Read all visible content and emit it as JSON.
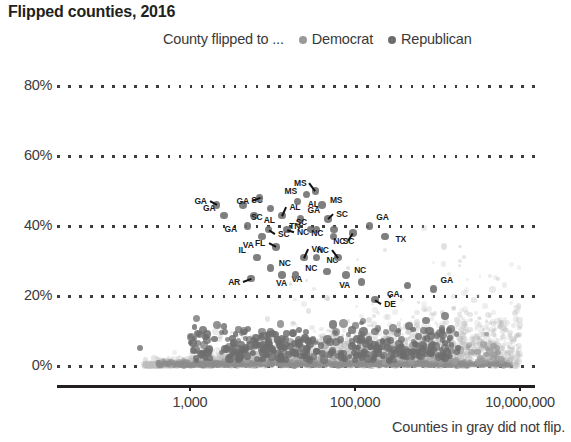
{
  "chart": {
    "title": "Flipped counties, 2016",
    "footnote": "Counties in gray did not flip.",
    "legend_prefix": "County flipped to ...",
    "legend": [
      {
        "label": "Democrat",
        "color": "#9a9a9a"
      },
      {
        "label": "Republican",
        "color": "#6d6d6d"
      }
    ]
  },
  "chart_data": {
    "type": "scatter",
    "title": "Flipped counties, 2016",
    "xlabel": "",
    "ylabel": "",
    "xscale": "log",
    "xlim": [
      250,
      30000000
    ],
    "ylim": [
      -3,
      88
    ],
    "grid": true,
    "grid_style": "dotted-horizontal",
    "legend_position": "top-center",
    "xtick_labels": [
      "1,000",
      "100,000",
      "10,000,000"
    ],
    "xtick_values": [
      1000,
      100000,
      10000000
    ],
    "ytick_labels": [
      "0%",
      "20%",
      "40%",
      "60%",
      "80%"
    ],
    "ytick_values": [
      0,
      20,
      40,
      60,
      80
    ],
    "annotation": "Counties in gray did not flip.",
    "series": [
      {
        "name": "Did not flip",
        "color": "#bdbdbd",
        "note": "Large low-opacity gray cloud concentrated near 0% and increasing in spread with county population"
      },
      {
        "name": "Flipped to Democrat",
        "color": "#9a9a9a",
        "note": "Medium-gray points, mostly larger-population counties"
      },
      {
        "name": "Flipped to Republican",
        "color": "#6d6d6d",
        "note": "Darker gray points spread from 0% up to about 50%"
      }
    ],
    "labeled_points": [
      {
        "state": "GA",
        "x": 2100,
        "y": 46
      },
      {
        "state": "GA",
        "x": 2600,
        "y": 43
      },
      {
        "state": "SC",
        "x": 4400,
        "y": 46
      },
      {
        "state": "GA",
        "x": 7000,
        "y": 48
      },
      {
        "state": "AL",
        "x": 6000,
        "y": 43
      },
      {
        "state": "SC",
        "x": 9500,
        "y": 45
      },
      {
        "state": "AL",
        "x": 13000,
        "y": 43
      },
      {
        "state": "AL",
        "x": 20000,
        "y": 47
      },
      {
        "state": "MS",
        "x": 26000,
        "y": 49
      },
      {
        "state": "MS",
        "x": 33000,
        "y": 50
      },
      {
        "state": "MS",
        "x": 40000,
        "y": 46
      },
      {
        "state": "GA",
        "x": 5000,
        "y": 40
      },
      {
        "state": "SC",
        "x": 9000,
        "y": 39
      },
      {
        "state": "VA",
        "x": 7500,
        "y": 37
      },
      {
        "state": "GA",
        "x": 22000,
        "y": 42
      },
      {
        "state": "NC",
        "x": 15000,
        "y": 39
      },
      {
        "state": "TN",
        "x": 29000,
        "y": 39
      },
      {
        "state": "SC",
        "x": 34000,
        "y": 39
      },
      {
        "state": "SC",
        "x": 47000,
        "y": 42
      },
      {
        "state": "NC",
        "x": 56000,
        "y": 39
      },
      {
        "state": "SC",
        "x": 55000,
        "y": 37
      },
      {
        "state": "NC",
        "x": 95000,
        "y": 38
      },
      {
        "state": "GA",
        "x": 150000,
        "y": 40
      },
      {
        "state": "TX",
        "x": 230000,
        "y": 37
      },
      {
        "state": "FL",
        "x": 11000,
        "y": 34
      },
      {
        "state": "IL",
        "x": 6500,
        "y": 31
      },
      {
        "state": "NC",
        "x": 9500,
        "y": 28
      },
      {
        "state": "AR",
        "x": 5500,
        "y": 25
      },
      {
        "state": "VA",
        "x": 13000,
        "y": 26
      },
      {
        "state": "VA",
        "x": 19000,
        "y": 26
      },
      {
        "state": "VA",
        "x": 24000,
        "y": 31
      },
      {
        "state": "NC",
        "x": 34000,
        "y": 31
      },
      {
        "state": "NC",
        "x": 46000,
        "y": 27
      },
      {
        "state": "NC",
        "x": 62000,
        "y": 31
      },
      {
        "state": "NC",
        "x": 78000,
        "y": 26
      },
      {
        "state": "VA",
        "x": 120000,
        "y": 24
      },
      {
        "state": "DE",
        "x": 175000,
        "y": 19
      },
      {
        "state": "GA",
        "x": 430000,
        "y": 23
      },
      {
        "state": "GA",
        "x": 900000,
        "y": 22
      }
    ]
  }
}
